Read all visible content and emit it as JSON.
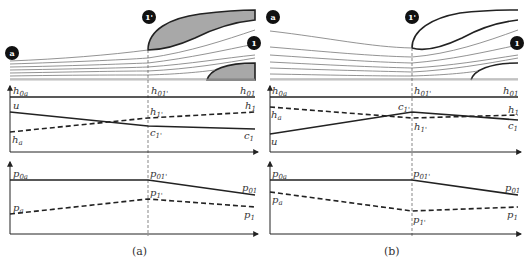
{
  "panels": [
    {
      "caption": "(a)",
      "stations": {
        "a": "a",
        "throat": "1'",
        "exit": "1"
      },
      "enthalpy_plot": {
        "total_labels": {
          "a": "h",
          "a_sub": "0a",
          "throat": "h",
          "throat_sub": "01'",
          "exit": "h",
          "exit_sub": "01"
        },
        "velocity_labels": {
          "a": "u",
          "throat": "c",
          "throat_sub": "1'",
          "exit": "c",
          "exit_sub": "1"
        },
        "static_labels": {
          "a": "h",
          "a_sub": "a",
          "throat": "h",
          "throat_sub": "1'",
          "exit": "h",
          "exit_sub": "1"
        }
      },
      "pressure_plot": {
        "total_labels": {
          "a": "p",
          "a_sub": "0a",
          "throat": "p",
          "throat_sub": "01'",
          "exit": "p",
          "exit_sub": "01"
        },
        "static_labels": {
          "a": "p",
          "a_sub": "a",
          "throat": "p",
          "throat_sub": "1'",
          "exit": "p",
          "exit_sub": "1"
        }
      }
    },
    {
      "caption": "(b)",
      "stations": {
        "a": "a",
        "throat": "1'",
        "exit": "1"
      },
      "enthalpy_plot": {
        "total_labels": {
          "a": "h",
          "a_sub": "0a",
          "throat": "h",
          "throat_sub": "01'",
          "exit": "h",
          "exit_sub": "01"
        },
        "velocity_labels": {
          "a": "u",
          "throat": "c",
          "throat_sub": "1'",
          "exit": "c",
          "exit_sub": "1"
        },
        "static_labels": {
          "a": "h",
          "a_sub": "a",
          "throat": "h",
          "throat_sub": "1'",
          "exit": "h",
          "exit_sub": "1"
        }
      },
      "pressure_plot": {
        "total_labels": {
          "a": "p",
          "a_sub": "0a",
          "throat": "p",
          "throat_sub": "01'",
          "exit": "p",
          "exit_sub": "01"
        },
        "static_labels": {
          "a": "p",
          "a_sub": "a",
          "throat": "p",
          "throat_sub": "1'",
          "exit": "p",
          "exit_sub": "1"
        }
      }
    }
  ],
  "colors": {
    "line": "#2a2a2a",
    "fill": "#a8a8a8",
    "stream": "#777777",
    "badge": "#111111"
  }
}
